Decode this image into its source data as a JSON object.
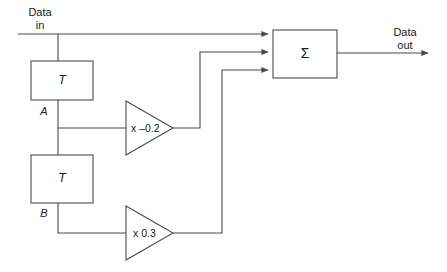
{
  "diagram": {
    "stroke_color": "#4a4a4a",
    "text_color": "#1a1a1a",
    "background_color": "#ffffff",
    "input": {
      "label_line1": "Data",
      "label_line2": "in"
    },
    "output": {
      "label_line1": "Data",
      "label_line2": "out"
    },
    "delay_blocks": [
      {
        "label": "T",
        "node_label": "A"
      },
      {
        "label": "T",
        "node_label": "B"
      }
    ],
    "gain_blocks": [
      {
        "label": "x –0.2",
        "value": -0.2
      },
      {
        "label": "x 0.3",
        "value": 0.3
      }
    ],
    "summing_block": {
      "label": "Σ",
      "input_count": 3
    }
  }
}
